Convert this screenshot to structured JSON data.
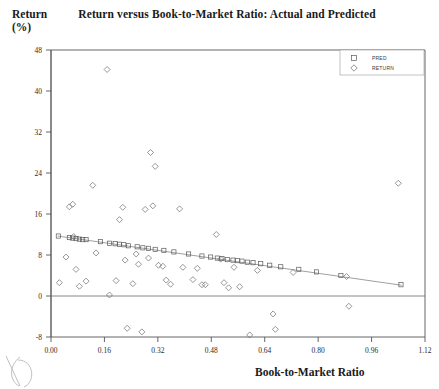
{
  "chart": {
    "title": "Return versus Book-to-Market Ratio: Actual and Predicted",
    "ylabel_line1": "Return",
    "ylabel_line2": "(%)",
    "xlabel": "Book-to-Market Ratio"
  },
  "legend": {
    "entries": [
      {
        "label": "PRED",
        "marker": "square"
      },
      {
        "label": "RETURN",
        "marker": "diamond"
      }
    ]
  },
  "chart_data": {
    "type": "scatter",
    "title": "Return versus Book-to-Market Ratio: Actual and Predicted",
    "xlabel": "Book-to-Market Ratio",
    "ylabel": "Return (%)",
    "xlim": [
      0.0,
      1.12
    ],
    "ylim": [
      -8,
      48
    ],
    "xticks": [
      0.0,
      0.16,
      0.32,
      0.48,
      0.64,
      0.8,
      0.96,
      1.12
    ],
    "xticklabels": [
      "0.00",
      "0.16",
      "0.32",
      "0.48",
      "0.64",
      "0.80",
      "0.96",
      "1.12"
    ],
    "yticks": [
      -8,
      0,
      8,
      16,
      24,
      32,
      40,
      48
    ],
    "yticklabels": [
      "-8",
      "0",
      "8",
      "16",
      "24",
      "32",
      "40",
      "48"
    ],
    "grid": false,
    "legend_position": "top-right",
    "zero_reference_line": 0,
    "series": [
      {
        "name": "RETURN",
        "marker": "diamond",
        "type": "scatter",
        "points": [
          [
            0.025,
            2.6
          ],
          [
            0.045,
            7.6
          ],
          [
            0.055,
            17.4
          ],
          [
            0.065,
            17.9
          ],
          [
            0.068,
            11.6
          ],
          [
            0.075,
            5.2
          ],
          [
            0.085,
            1.9
          ],
          [
            0.105,
            2.9
          ],
          [
            0.125,
            21.6
          ],
          [
            0.135,
            8.4
          ],
          [
            0.168,
            44.2
          ],
          [
            0.175,
            0.2
          ],
          [
            0.195,
            3.0
          ],
          [
            0.205,
            14.9
          ],
          [
            0.215,
            17.3
          ],
          [
            0.222,
            7.0
          ],
          [
            0.228,
            -6.3
          ],
          [
            0.245,
            2.4
          ],
          [
            0.255,
            8.2
          ],
          [
            0.262,
            6.2
          ],
          [
            0.272,
            -7.0
          ],
          [
            0.282,
            16.9
          ],
          [
            0.292,
            7.4
          ],
          [
            0.298,
            28.0
          ],
          [
            0.305,
            17.6
          ],
          [
            0.312,
            25.3
          ],
          [
            0.322,
            6.0
          ],
          [
            0.335,
            5.8
          ],
          [
            0.345,
            3.1
          ],
          [
            0.358,
            2.3
          ],
          [
            0.385,
            17.0
          ],
          [
            0.395,
            5.6
          ],
          [
            0.425,
            3.2
          ],
          [
            0.438,
            5.4
          ],
          [
            0.452,
            2.2
          ],
          [
            0.462,
            2.2
          ],
          [
            0.495,
            12.0
          ],
          [
            0.508,
            7.2
          ],
          [
            0.518,
            2.6
          ],
          [
            0.532,
            1.6
          ],
          [
            0.548,
            5.6
          ],
          [
            0.565,
            1.8
          ],
          [
            0.595,
            -7.6
          ],
          [
            0.618,
            5.0
          ],
          [
            0.665,
            -3.5
          ],
          [
            0.672,
            -6.5
          ],
          [
            0.725,
            4.6
          ],
          [
            0.885,
            3.8
          ],
          [
            0.892,
            -2.0
          ],
          [
            1.04,
            22.0
          ]
        ]
      },
      {
        "name": "PRED",
        "marker": "square",
        "type": "line+scatter",
        "fit_line": {
          "x0": 0.02,
          "y0": 11.7,
          "x1": 1.05,
          "y1": 2.1
        },
        "points": [
          [
            0.022,
            11.7
          ],
          [
            0.055,
            11.4
          ],
          [
            0.065,
            11.3
          ],
          [
            0.075,
            11.2
          ],
          [
            0.085,
            11.1
          ],
          [
            0.095,
            11.0
          ],
          [
            0.105,
            11.0
          ],
          [
            0.148,
            10.6
          ],
          [
            0.175,
            10.3
          ],
          [
            0.192,
            10.2
          ],
          [
            0.205,
            10.1
          ],
          [
            0.218,
            10.0
          ],
          [
            0.232,
            9.8
          ],
          [
            0.258,
            9.6
          ],
          [
            0.275,
            9.4
          ],
          [
            0.292,
            9.3
          ],
          [
            0.312,
            9.1
          ],
          [
            0.338,
            8.9
          ],
          [
            0.368,
            8.6
          ],
          [
            0.412,
            8.2
          ],
          [
            0.452,
            7.8
          ],
          [
            0.478,
            7.6
          ],
          [
            0.498,
            7.4
          ],
          [
            0.512,
            7.3
          ],
          [
            0.528,
            7.1
          ],
          [
            0.545,
            7.0
          ],
          [
            0.558,
            6.9
          ],
          [
            0.572,
            6.8
          ],
          [
            0.588,
            6.6
          ],
          [
            0.605,
            6.5
          ],
          [
            0.628,
            6.3
          ],
          [
            0.655,
            6.0
          ],
          [
            0.688,
            5.7
          ],
          [
            0.742,
            5.2
          ],
          [
            0.795,
            4.7
          ],
          [
            0.868,
            4.0
          ],
          [
            1.048,
            2.2
          ]
        ]
      }
    ]
  }
}
